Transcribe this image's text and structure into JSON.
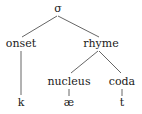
{
  "diagram": {
    "type": "syllable-tree",
    "nodes": {
      "root": {
        "label": "σ",
        "x": 58,
        "y": 12
      },
      "onset": {
        "label": "onset",
        "x": 21,
        "y": 47
      },
      "rhyme": {
        "label": "rhyme",
        "x": 101,
        "y": 47
      },
      "nucleus": {
        "label": "nucleus",
        "x": 69,
        "y": 85
      },
      "coda": {
        "label": "coda",
        "x": 122,
        "y": 85
      },
      "k": {
        "label": "k",
        "x": 21,
        "y": 106
      },
      "ae": {
        "label": "æ",
        "x": 69,
        "y": 106
      },
      "t": {
        "label": "t",
        "x": 122,
        "y": 106
      }
    },
    "edges": [
      {
        "from": "root",
        "to": "onset"
      },
      {
        "from": "root",
        "to": "rhyme"
      },
      {
        "from": "onset",
        "to": "k"
      },
      {
        "from": "rhyme",
        "to": "nucleus"
      },
      {
        "from": "rhyme",
        "to": "coda"
      },
      {
        "from": "nucleus",
        "to": "ae"
      },
      {
        "from": "coda",
        "to": "t"
      }
    ],
    "colors": {
      "text": "#1a1a1a",
      "edge": "#555555",
      "background": "#ffffff"
    }
  }
}
